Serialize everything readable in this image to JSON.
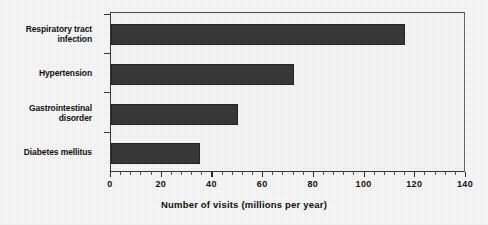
{
  "chart_data": {
    "type": "bar",
    "orientation": "horizontal",
    "title": "",
    "xlabel": "Number of visits (millions per year)",
    "ylabel": "",
    "categories": [
      "Respiratory tract infection",
      "Hypertension",
      "Gastrointestinal disorder",
      "Diabetes mellitus"
    ],
    "values": [
      116,
      72,
      50,
      35
    ],
    "xlim": [
      0,
      140
    ],
    "xticks": [
      0,
      20,
      40,
      60,
      80,
      100,
      120,
      140
    ],
    "xtick_labels": [
      "0",
      "20",
      "40",
      "60",
      "80",
      "100",
      "120",
      "140"
    ],
    "grid": false,
    "legend": null,
    "bar_color": "#3a3a3a",
    "plot_background": "#fbfbfb",
    "frame_color": "#3a3a3a"
  },
  "axis": {
    "x_title": "Number of visits (millions per year)",
    "ticks": [
      {
        "label": "0",
        "value": 0
      },
      {
        "label": "20",
        "value": 20
      },
      {
        "label": "40",
        "value": 40
      },
      {
        "label": "60",
        "value": 60
      },
      {
        "label": "80",
        "value": 80
      },
      {
        "label": "100",
        "value": 100
      },
      {
        "label": "120",
        "value": 120
      },
      {
        "label": "140",
        "value": 140
      }
    ]
  },
  "categories": [
    {
      "line1": "Respiratory tract",
      "line2": "infection"
    },
    {
      "line1": "Hypertension",
      "line2": ""
    },
    {
      "line1": "Gastrointestinal",
      "line2": "disorder"
    },
    {
      "line1": "Diabetes mellitus",
      "line2": ""
    }
  ]
}
